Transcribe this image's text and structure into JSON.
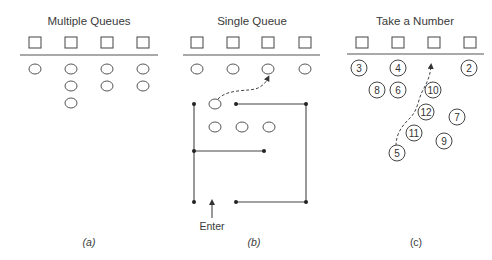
{
  "panels": [
    {
      "id": "a",
      "title": "Multiple Queues",
      "caption": "(a)",
      "servers": 4,
      "queue_lengths": [
        1,
        3,
        2,
        2
      ]
    },
    {
      "id": "b",
      "title": "Single Queue",
      "caption": "(b)",
      "servers": 4,
      "customers_at_servers": 4,
      "customers_in_serpentine_line": 4,
      "entry_label": "Enter"
    },
    {
      "id": "c",
      "title": "Take a Number",
      "caption": "(c)",
      "servers": 4,
      "numbered_customers": [
        "3",
        "4",
        "2",
        "8",
        "6",
        "10",
        "12",
        "7",
        "11",
        "9",
        "5"
      ]
    }
  ],
  "colors": {
    "stroke": "#444444",
    "text": "#3a3a3a",
    "background": "#ffffff"
  }
}
